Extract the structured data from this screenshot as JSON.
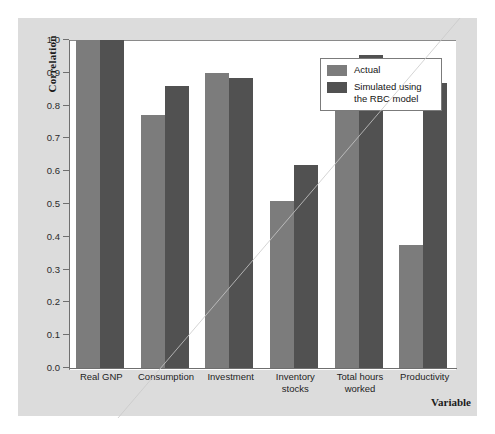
{
  "chart_data": {
    "type": "bar",
    "title": "",
    "xlabel": "Variable",
    "ylabel": "Correlation",
    "ylim": [
      0.0,
      1.0
    ],
    "grid": false,
    "legend_position": "top-right",
    "ytick_labels": [
      "1.0",
      "0.9",
      "0.8",
      "0.7",
      "0.6",
      "0.5",
      "0.4",
      "0.3",
      "0.2",
      "0.1",
      "0.0"
    ],
    "ytick_values": [
      1.0,
      0.9,
      0.8,
      0.7,
      0.6,
      0.5,
      0.4,
      0.3,
      0.2,
      0.1,
      0.0
    ],
    "categories": [
      "Real GNP",
      "Consumption",
      "Investment",
      "Inventory stocks",
      "Total hours worked",
      "Productivity"
    ],
    "category_label_lines": [
      [
        "Real GNP"
      ],
      [
        "Consumption"
      ],
      [
        "Investment"
      ],
      [
        "Inventory",
        "stocks"
      ],
      [
        "Total hours",
        "worked"
      ],
      [
        "Productivity"
      ]
    ],
    "series": [
      {
        "name": "Actual",
        "color": "#7c7c7c",
        "values": [
          1.0,
          0.77,
          0.9,
          0.51,
          0.86,
          0.375
        ]
      },
      {
        "name": "Simulated using the RBC model",
        "color": "#515151",
        "values": [
          1.0,
          0.86,
          0.885,
          0.62,
          0.955,
          0.87
        ]
      }
    ]
  },
  "legend": {
    "entries": [
      {
        "label_lines": [
          "Actual"
        ],
        "color": "#7c7c7c"
      },
      {
        "label_lines": [
          "Simulated using",
          "the RBC model"
        ],
        "color": "#515151"
      }
    ]
  },
  "axes": {
    "y_title": "Correlation",
    "x_title": "Variable"
  },
  "colors": {
    "page_background": "#ffffff",
    "panel_background": "#dcdcdc",
    "plot_background": "#ffffff",
    "axis_line": "#6f6f6f",
    "series_actual": "#7c7c7c",
    "series_simulated": "#515151",
    "text": "#1b1b1b"
  }
}
